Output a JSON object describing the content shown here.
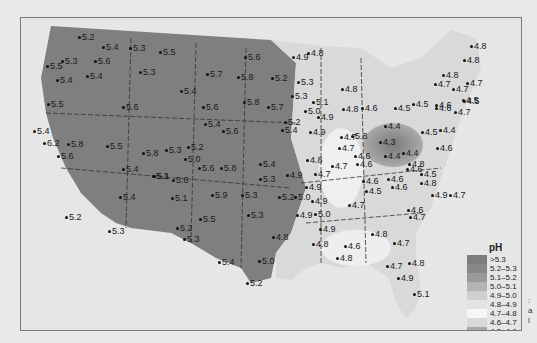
{
  "legend": {
    "title": "pH",
    "items": [
      {
        "label": ">5.3",
        "color": "#7d7d7d"
      },
      {
        "label": "5.2–5.3",
        "color": "#888888"
      },
      {
        "label": "5.1–5.2",
        "color": "#9a9a9a"
      },
      {
        "label": "5.0–5.1",
        "color": "#b4b4b4"
      },
      {
        "label": "4.9–5.0",
        "color": "#cfcfcf"
      },
      {
        "label": "4.8–4.9",
        "color": "#e3e3e3"
      },
      {
        "label": "4.7–4.8",
        "color": "#f6f6f6"
      },
      {
        "label": "4.6–4.7",
        "color": "#d8d8d8"
      },
      {
        "label": "4.5–4.6",
        "color": "#a8a8a8"
      },
      {
        "label": "4.4–4.5",
        "color": "#8a8a8a"
      },
      {
        "label": "4.3–4.4",
        "color": "#6a6a6a"
      },
      {
        "label": "<4.3",
        "color": "#4a4a4a"
      }
    ]
  },
  "stations": [
    {
      "v": "5.2",
      "x": 77,
      "y": 36
    },
    {
      "v": "5.4",
      "x": 101,
      "y": 46
    },
    {
      "v": "5.3",
      "x": 128,
      "y": 47
    },
    {
      "v": "5.5",
      "x": 158,
      "y": 51
    },
    {
      "v": "5.5",
      "x": 45,
      "y": 65
    },
    {
      "v": "5.3",
      "x": 60,
      "y": 60
    },
    {
      "v": "5.6",
      "x": 93,
      "y": 60
    },
    {
      "v": "5.3",
      "x": 138,
      "y": 71
    },
    {
      "v": "5.4",
      "x": 55,
      "y": 79
    },
    {
      "v": "5.4",
      "x": 85,
      "y": 75
    },
    {
      "v": "5.5",
      "x": 46,
      "y": 103
    },
    {
      "v": "5.6",
      "x": 121,
      "y": 106
    },
    {
      "v": "5.4",
      "x": 32,
      "y": 130
    },
    {
      "v": "6.2",
      "x": 42,
      "y": 142
    },
    {
      "v": "5.8",
      "x": 66,
      "y": 143
    },
    {
      "v": "5.5",
      "x": 105,
      "y": 145
    },
    {
      "v": "5.6",
      "x": 56,
      "y": 155
    },
    {
      "v": "5.8",
      "x": 141,
      "y": 152
    },
    {
      "v": "5.4",
      "x": 121,
      "y": 168
    },
    {
      "v": "5.1",
      "x": 151,
      "y": 175
    },
    {
      "v": "5.4",
      "x": 118,
      "y": 196
    },
    {
      "v": "5.2",
      "x": 64,
      "y": 216
    },
    {
      "v": "5.3",
      "x": 107,
      "y": 230
    },
    {
      "v": "5.6",
      "x": 243,
      "y": 56
    },
    {
      "v": "5.7",
      "x": 205,
      "y": 73
    },
    {
      "v": "5.8",
      "x": 236,
      "y": 76
    },
    {
      "v": "5.2",
      "x": 270,
      "y": 77
    },
    {
      "v": "5.4",
      "x": 179,
      "y": 90
    },
    {
      "v": "5.6",
      "x": 201,
      "y": 106
    },
    {
      "v": "5.8",
      "x": 242,
      "y": 101
    },
    {
      "v": "5.7",
      "x": 266,
      "y": 106
    },
    {
      "v": "5.3",
      "x": 290,
      "y": 95
    },
    {
      "v": "5.4",
      "x": 203,
      "y": 123
    },
    {
      "v": "5.6",
      "x": 221,
      "y": 130
    },
    {
      "v": "5.8",
      "x": 350,
      "y": 135
    },
    {
      "v": "5.4",
      "x": 280,
      "y": 129
    },
    {
      "v": "5.3",
      "x": 164,
      "y": 149
    },
    {
      "v": "5.2",
      "x": 186,
      "y": 146
    },
    {
      "v": "5.0",
      "x": 183,
      "y": 158
    },
    {
      "v": "5.6",
      "x": 197,
      "y": 167
    },
    {
      "v": "5.8",
      "x": 219,
      "y": 167
    },
    {
      "v": "5.4",
      "x": 258,
      "y": 163
    },
    {
      "v": "5.1",
      "x": 152,
      "y": 175
    },
    {
      "v": "5.6",
      "x": 171,
      "y": 179
    },
    {
      "v": "5.3",
      "x": 258,
      "y": 178
    },
    {
      "v": "5.1",
      "x": 170,
      "y": 197
    },
    {
      "v": "5.9",
      "x": 210,
      "y": 194
    },
    {
      "v": "5.3",
      "x": 240,
      "y": 194
    },
    {
      "v": "5.2",
      "x": 277,
      "y": 196
    },
    {
      "v": "5.0",
      "x": 293,
      "y": 196
    },
    {
      "v": "5.3",
      "x": 246,
      "y": 214
    },
    {
      "v": "5.5",
      "x": 198,
      "y": 218
    },
    {
      "v": "5.2",
      "x": 175,
      "y": 227
    },
    {
      "v": "5.3",
      "x": 182,
      "y": 238
    },
    {
      "v": "5.4",
      "x": 217,
      "y": 261
    },
    {
      "v": "5.0",
      "x": 257,
      "y": 260
    },
    {
      "v": "5.2",
      "x": 245,
      "y": 282
    },
    {
      "v": "4.8",
      "x": 271,
      "y": 236
    },
    {
      "v": "4.9",
      "x": 295,
      "y": 214
    },
    {
      "v": "4.9",
      "x": 291,
      "y": 56
    },
    {
      "v": "4.8",
      "x": 306,
      "y": 52
    },
    {
      "v": "5.3",
      "x": 296,
      "y": 81
    },
    {
      "v": "5.1",
      "x": 311,
      "y": 101
    },
    {
      "v": "5.0",
      "x": 303,
      "y": 110
    },
    {
      "v": "4.9",
      "x": 316,
      "y": 116
    },
    {
      "v": "5.2",
      "x": 283,
      "y": 121
    },
    {
      "v": "4.9",
      "x": 308,
      "y": 131
    },
    {
      "v": "4.8",
      "x": 340,
      "y": 88
    },
    {
      "v": "4.8",
      "x": 341,
      "y": 108
    },
    {
      "v": "4.6",
      "x": 360,
      "y": 107
    },
    {
      "v": "4.8",
      "x": 305,
      "y": 159
    },
    {
      "v": "4.9",
      "x": 304,
      "y": 186
    },
    {
      "v": "4.9",
      "x": 285,
      "y": 174
    },
    {
      "v": "4.7",
      "x": 313,
      "y": 173
    },
    {
      "v": "4.7",
      "x": 339,
      "y": 136
    },
    {
      "v": "4.7",
      "x": 337,
      "y": 147
    },
    {
      "v": "4.6",
      "x": 353,
      "y": 155
    },
    {
      "v": "4.7",
      "x": 330,
      "y": 165
    },
    {
      "v": "4.6",
      "x": 355,
      "y": 163
    },
    {
      "v": "4.6",
      "x": 361,
      "y": 180
    },
    {
      "v": "4.5",
      "x": 364,
      "y": 190
    },
    {
      "v": "4.7",
      "x": 347,
      "y": 204
    },
    {
      "v": "4.9",
      "x": 310,
      "y": 200
    },
    {
      "v": "5.0",
      "x": 313,
      "y": 213
    },
    {
      "v": "4.9",
      "x": 318,
      "y": 228
    },
    {
      "v": "4.8",
      "x": 311,
      "y": 243
    },
    {
      "v": "4.6",
      "x": 343,
      "y": 245
    },
    {
      "v": "4.8",
      "x": 335,
      "y": 257
    },
    {
      "v": "4.8",
      "x": 370,
      "y": 233
    },
    {
      "v": "4.7",
      "x": 392,
      "y": 242
    },
    {
      "v": "4.8",
      "x": 407,
      "y": 262
    },
    {
      "v": "4.7",
      "x": 385,
      "y": 265
    },
    {
      "v": "4.9",
      "x": 396,
      "y": 277
    },
    {
      "v": "5.1",
      "x": 412,
      "y": 293
    },
    {
      "v": "4.6",
      "x": 406,
      "y": 209
    },
    {
      "v": "4.7",
      "x": 408,
      "y": 216
    },
    {
      "v": "4.6",
      "x": 405,
      "y": 168
    },
    {
      "v": "4.4",
      "x": 383,
      "y": 155
    },
    {
      "v": "4.4",
      "x": 401,
      "y": 152
    },
    {
      "v": "4.3",
      "x": 378,
      "y": 141
    },
    {
      "v": "4.4",
      "x": 383,
      "y": 125
    },
    {
      "v": "4.5",
      "x": 393,
      "y": 107
    },
    {
      "v": "4.5",
      "x": 420,
      "y": 131
    },
    {
      "v": "4.4",
      "x": 438,
      "y": 129
    },
    {
      "v": "4.6",
      "x": 435,
      "y": 147
    },
    {
      "v": "4.8",
      "x": 407,
      "y": 163
    },
    {
      "v": "4.5",
      "x": 419,
      "y": 173
    },
    {
      "v": "4.6",
      "x": 386,
      "y": 178
    },
    {
      "v": "4.6",
      "x": 390,
      "y": 186
    },
    {
      "v": "4.8",
      "x": 419,
      "y": 182
    },
    {
      "v": "4.9",
      "x": 430,
      "y": 194
    },
    {
      "v": "4.7",
      "x": 448,
      "y": 194
    },
    {
      "v": "4.6",
      "x": 434,
      "y": 107
    },
    {
      "v": "4.5",
      "x": 462,
      "y": 100
    },
    {
      "v": "4.7",
      "x": 453,
      "y": 111
    },
    {
      "v": "4.6",
      "x": 434,
      "y": 104
    },
    {
      "v": "4.5",
      "x": 411,
      "y": 103
    },
    {
      "v": "4.7",
      "x": 433,
      "y": 83
    },
    {
      "v": "4.8",
      "x": 441,
      "y": 74
    },
    {
      "v": "4.7",
      "x": 465,
      "y": 82
    },
    {
      "v": "4.7",
      "x": 451,
      "y": 88
    },
    {
      "v": "4.5",
      "x": 461,
      "y": 99
    },
    {
      "v": "4.8",
      "x": 462,
      "y": 59
    },
    {
      "v": "4.8",
      "x": 469,
      "y": 45
    }
  ]
}
